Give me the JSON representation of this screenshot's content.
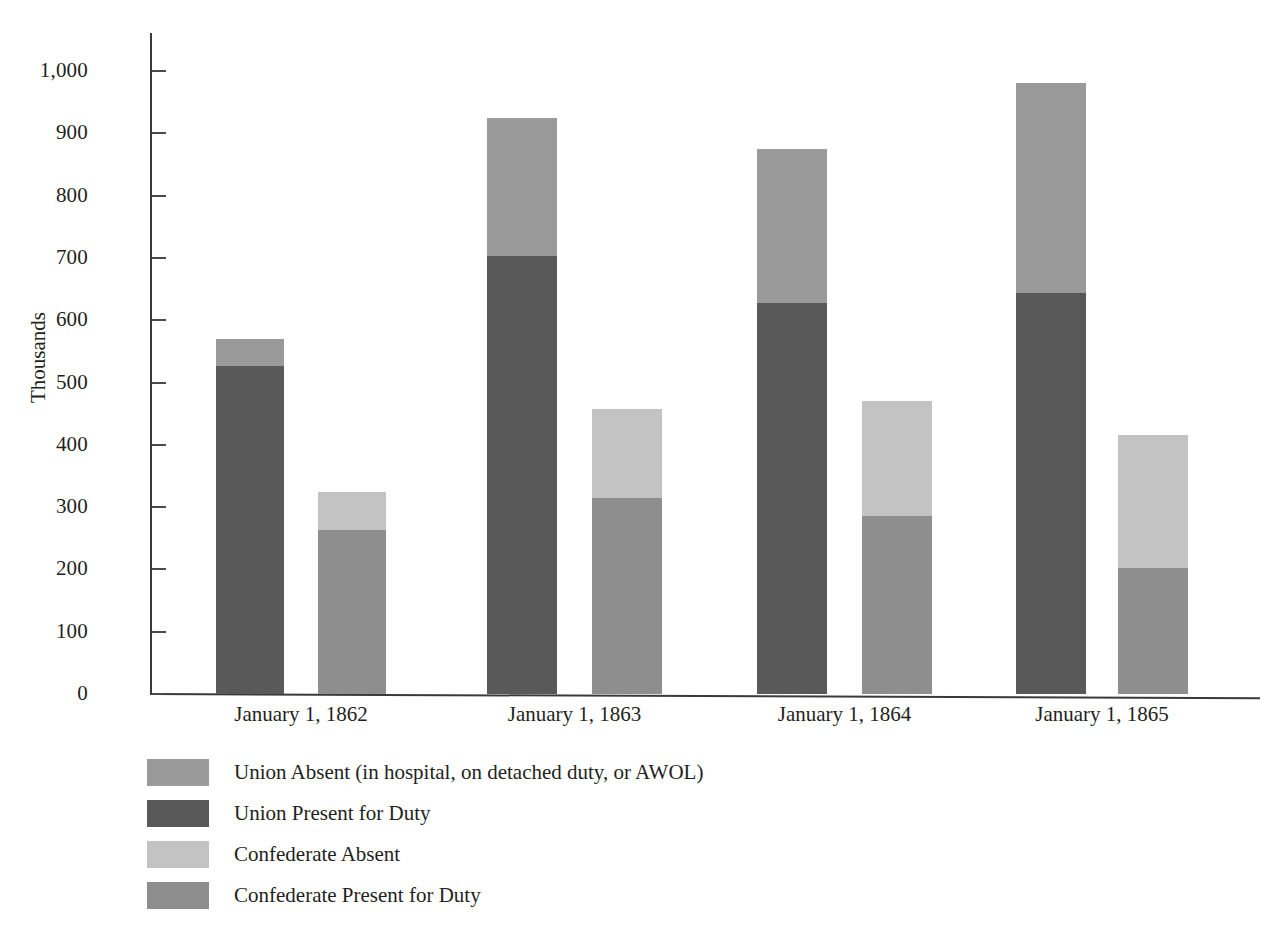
{
  "chart_data": {
    "type": "bar",
    "subtype": "grouped-stacked",
    "title": "",
    "xlabel": "",
    "ylabel": "Thousands",
    "ylim": [
      0,
      1050
    ],
    "ytick_step": 100,
    "grid": false,
    "legend_position": "bottom-left",
    "categories": [
      "January 1, 1862",
      "January 1, 1863",
      "January 1, 1864",
      "January 1, 1865"
    ],
    "ytick_labels": [
      "0",
      "100",
      "200",
      "300",
      "400",
      "500",
      "600",
      "700",
      "800",
      "900",
      "1,000"
    ],
    "ytick_values": [
      0,
      100,
      200,
      300,
      400,
      500,
      600,
      700,
      800,
      900,
      1000
    ],
    "series": [
      {
        "name": "Union Present for Duty",
        "group": "Union",
        "stack_order": 1,
        "color": "#595959",
        "values": [
          527,
          703,
          627,
          644
        ]
      },
      {
        "name": "Union Absent (in hospital, on detached duty, or AWOL)",
        "group": "Union",
        "stack_order": 2,
        "color": "#9a9a9a",
        "values": [
          43,
          221,
          248,
          337
        ]
      },
      {
        "name": "Confederate Present for Duty",
        "group": "Confederate",
        "stack_order": 1,
        "color": "#8e8e8e",
        "values": [
          263,
          315,
          285,
          202
        ]
      },
      {
        "name": "Confederate Absent",
        "group": "Confederate",
        "stack_order": 2,
        "color": "#c3c3c3",
        "values": [
          62,
          143,
          186,
          213
        ]
      }
    ],
    "group_totals": {
      "Union": [
        570,
        924,
        875,
        981
      ],
      "Confederate": [
        325,
        458,
        471,
        415
      ]
    }
  },
  "legend": {
    "items": [
      {
        "label": "Union Absent (in hospital, on detached duty, or AWOL)",
        "color": "#9a9a9a"
      },
      {
        "label": "Union Present for Duty",
        "color": "#595959"
      },
      {
        "label": "Confederate Absent",
        "color": "#c3c3c3"
      },
      {
        "label": "Confederate Present for Duty",
        "color": "#8e8e8e"
      }
    ]
  },
  "colors": {
    "union_absent": "#9a9a9a",
    "union_present": "#595959",
    "confederate_absent": "#c3c3c3",
    "confederate_present": "#8e8e8e",
    "axis": "#3a3a3a",
    "text": "#231f20",
    "background": "#ffffff"
  }
}
